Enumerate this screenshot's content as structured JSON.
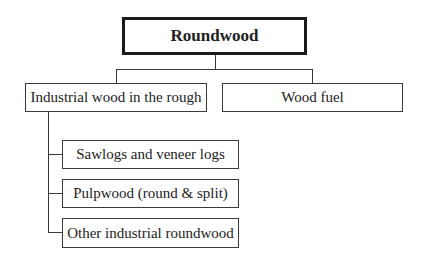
{
  "diagram": {
    "root": {
      "label": "Roundwood"
    },
    "level1": [
      {
        "label": "Industrial wood in the rough"
      },
      {
        "label": "Wood fuel"
      }
    ],
    "industrial_children": [
      {
        "label": "Sawlogs and veneer logs"
      },
      {
        "label": "Pulpwood (round & split)"
      },
      {
        "label": "Other industrial roundwood"
      }
    ],
    "edges": [
      {
        "from": "Roundwood",
        "to": "Industrial wood in the rough"
      },
      {
        "from": "Roundwood",
        "to": "Wood fuel"
      },
      {
        "from": "Industrial wood in the rough",
        "to": "Sawlogs and veneer logs"
      },
      {
        "from": "Industrial wood in the rough",
        "to": "Pulpwood (round & split)"
      },
      {
        "from": "Industrial wood in the rough",
        "to": "Other industrial roundwood"
      }
    ]
  }
}
